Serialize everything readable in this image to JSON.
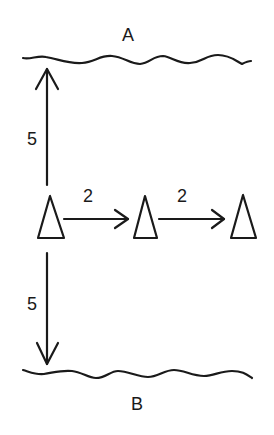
{
  "diagram": {
    "boundaries": [
      {
        "id": "top",
        "label": "A"
      },
      {
        "id": "bottom",
        "label": "B"
      }
    ],
    "distances": {
      "to_A": "5",
      "to_B": "5",
      "cone1_to_cone2": "2",
      "cone2_to_cone3": "2"
    },
    "cones": [
      {
        "id": "cone-1"
      },
      {
        "id": "cone-2"
      },
      {
        "id": "cone-3"
      }
    ],
    "colors": {
      "ink": "#1a1a1a",
      "background": "#ffffff"
    }
  }
}
